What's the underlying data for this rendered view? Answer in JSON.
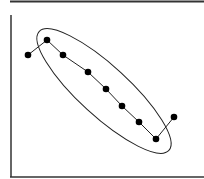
{
  "chart_data": {
    "type": "scatter",
    "title": "",
    "xlabel": "",
    "ylabel": "",
    "grid": false,
    "connected": true,
    "points": [
      {
        "x": 28,
        "y": 55
      },
      {
        "x": 47,
        "y": 40
      },
      {
        "x": 63,
        "y": 55
      },
      {
        "x": 88,
        "y": 72
      },
      {
        "x": 106,
        "y": 89
      },
      {
        "x": 122,
        "y": 106
      },
      {
        "x": 139,
        "y": 122
      },
      {
        "x": 156,
        "y": 139
      },
      {
        "x": 174,
        "y": 117
      }
    ],
    "annotations": [
      {
        "type": "ellipse",
        "cx": 104,
        "cy": 91,
        "rx": 88,
        "ry": 25,
        "rotation_deg": 42.5,
        "description": "ellipse enclosing the 7 central points"
      }
    ]
  },
  "colors": {
    "line": "#222222",
    "marker": "#000000",
    "axis": "#333333",
    "background": "#ffffff"
  }
}
